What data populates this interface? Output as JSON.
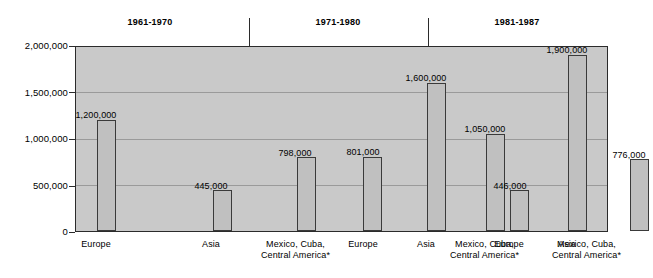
{
  "chart_data": {
    "type": "bar",
    "title": "",
    "subtitle": "",
    "xlabel": "",
    "ylabel": "",
    "ylim": [
      0,
      2000000
    ],
    "grid": true,
    "legend_position": "none",
    "categories": [
      "Europe",
      "Asia",
      "Mexico, Cuba, Central America*"
    ],
    "group_labels": [
      "1961-1970",
      "1971-1980",
      "1981-1987"
    ],
    "ytick_labels": [
      "0",
      "500,000",
      "1,000,000",
      "1,500,000",
      "2,000,000"
    ],
    "ytick_values": [
      0,
      500000,
      1000000,
      1500000,
      2000000
    ],
    "groups": [
      {
        "label": "1961-1970",
        "bars": [
          {
            "category": "Europe",
            "value": 1200000,
            "value_label": "1,200,000"
          },
          {
            "category": "Asia",
            "value": 445000,
            "value_label": "445,000"
          },
          {
            "category": "Mexico, Cuba, Central America*",
            "value": 798000,
            "value_label": "798,000"
          }
        ]
      },
      {
        "label": "1971-1980",
        "bars": [
          {
            "category": "Europe",
            "value": 801000,
            "value_label": "801,000"
          },
          {
            "category": "Asia",
            "value": 1600000,
            "value_label": "1,600,000"
          },
          {
            "category": "Mexico, Cuba, Central America*",
            "value": 1050000,
            "value_label": "1,050,000"
          }
        ]
      },
      {
        "label": "1981-1987",
        "bars": [
          {
            "category": "Europe",
            "value": 446000,
            "value_label": "446,000"
          },
          {
            "category": "Asia",
            "value": 1900000,
            "value_label": "1,900,000"
          },
          {
            "category": "Mexico, Cuba, Central America*",
            "value": 776000,
            "value_label": "776,000"
          }
        ]
      }
    ],
    "series": [
      {
        "name": "Europe",
        "values": [
          1200000,
          801000,
          446000
        ]
      },
      {
        "name": "Asia",
        "values": [
          445000,
          1600000,
          1900000
        ]
      },
      {
        "name": "Mexico, Cuba, Central America*",
        "values": [
          798000,
          1050000,
          776000
        ]
      }
    ],
    "colors": {
      "plot_background": "#c9c9c9",
      "bar_fill": "#c0c0c0",
      "bar_edge": "#3a3a3a",
      "axis": "#2b2b2b",
      "gridline": "#9a9a9a",
      "text": "#000000",
      "page_background": "#ffffff"
    }
  },
  "axis_label_lines": {
    "europe": [
      "Europe"
    ],
    "asia": [
      "Asia"
    ],
    "mexico": [
      "Mexico, Cuba,",
      "Central America*"
    ]
  }
}
